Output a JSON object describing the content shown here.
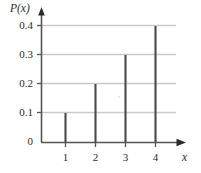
{
  "chart_data": {
    "type": "bar",
    "title": "",
    "subtitle": "",
    "xlabel": "x",
    "ylabel": "P(x)",
    "categories": [
      "1",
      "2",
      "3",
      "4"
    ],
    "values": [
      0.1,
      0.2,
      0.3,
      0.4
    ],
    "series": [
      {
        "name": "P(x)",
        "values": [
          0.1,
          0.2,
          0.3,
          0.4
        ]
      }
    ],
    "xlim": [
      0,
      4.8
    ],
    "ylim": [
      0,
      0.44
    ],
    "y_ticks": [
      "0",
      "0.1",
      "0.2",
      "0.3",
      "0.4"
    ],
    "y_tick_values": [
      0,
      0.1,
      0.2,
      0.3,
      0.4
    ],
    "x_ticks": [
      "1",
      "2",
      "3",
      "4"
    ],
    "x_tick_values": [
      1,
      2,
      3,
      4
    ],
    "grid": true,
    "grid_axis": "y",
    "legend": false,
    "legend_position": "none",
    "annotations": [],
    "style": {
      "bar_color": "#4a4a4a",
      "grid_color": "#c9c9c9",
      "axis_color": "#555555",
      "text_color": "#2b2b2b",
      "background": "#ffffff",
      "bar_width_px": 2
    }
  },
  "axes": {
    "y_axis_label": "P(x)",
    "x_axis_label": "x",
    "y_tick_labels": [
      "0.4",
      "0.3",
      "0.2",
      "0.1",
      "0"
    ],
    "x_tick_labels": [
      "1",
      "2",
      "3",
      "4"
    ]
  }
}
